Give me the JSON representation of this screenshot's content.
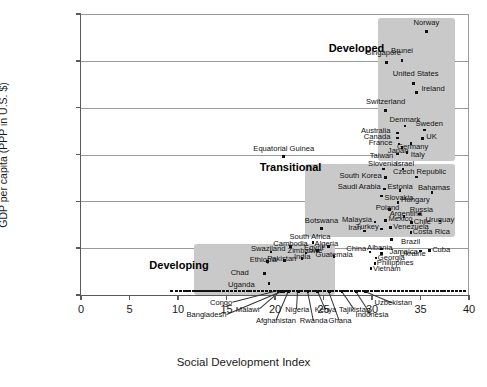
{
  "chart_data": {
    "type": "scatter",
    "title": "",
    "xlabel": "Social Development Index",
    "ylabel": "GDP per capita (PPP in U.S. $)",
    "xlim": [
      0,
      40
    ],
    "ylim": [
      0,
      60000
    ],
    "xticks": [
      "0",
      "5",
      "10",
      "15",
      "20",
      "25",
      "30",
      "35",
      "40"
    ],
    "xtick_values": [
      0,
      5,
      10,
      15,
      20,
      25,
      30,
      35,
      40
    ],
    "yticks": [
      "$0",
      "$10,000",
      "$20,000",
      "$30,000",
      "$40,000",
      "$50,000",
      "$60,000"
    ],
    "ytick_values": [
      0,
      10000,
      20000,
      30000,
      40000,
      50000,
      60000
    ],
    "grid": "horizontal",
    "legend": "none",
    "marker_color": "#111111",
    "cluster_fill": "#c9c9c9",
    "clusters": [
      {
        "name": "Developed",
        "label": "Developed",
        "label_x": 28.4,
        "label_y": 52600,
        "box_x0": 30.6,
        "box_x1": 38.6,
        "box_y0": 28600,
        "box_y1": 59100
      },
      {
        "name": "Transitional",
        "label": "Transitional",
        "label_x": 21.6,
        "label_y": 27200,
        "box_x0": 23.1,
        "box_x1": 38.6,
        "box_y0": 12400,
        "box_y1": 28000
      },
      {
        "name": "Developing",
        "label": "Developing",
        "label_x": 10.1,
        "label_y": 6100,
        "box_x0": 11.6,
        "box_x1": 26.2,
        "box_y0": -900,
        "box_y1": 10900
      }
    ],
    "points": [
      {
        "name": "Norway",
        "x": 35.6,
        "y": 56200,
        "lx": 35.6,
        "ly": 58000,
        "anchor": "c"
      },
      {
        "name": "Brunei",
        "x": 33.1,
        "y": 50100,
        "lx": 33.1,
        "ly": 52000,
        "anchor": "c"
      },
      {
        "name": "Singapore",
        "x": 31.5,
        "y": 49700,
        "lx": 31.2,
        "ly": 51600,
        "anchor": "c"
      },
      {
        "name": "United States",
        "x": 34.3,
        "y": 45200,
        "lx": 34.5,
        "ly": 47200,
        "anchor": "c"
      },
      {
        "name": "Ireland",
        "x": 34.6,
        "y": 43300,
        "lx": 35.1,
        "ly": 43900,
        "anchor": "l"
      },
      {
        "name": "Switzerland",
        "x": 31.4,
        "y": 39400,
        "lx": 31.4,
        "ly": 41300,
        "anchor": "c"
      },
      {
        "name": "Denmark",
        "x": 33.4,
        "y": 36100,
        "lx": 33.4,
        "ly": 37300,
        "anchor": "c"
      },
      {
        "name": "Sweden",
        "x": 35.4,
        "y": 35200,
        "lx": 35.9,
        "ly": 36500,
        "anchor": "c"
      },
      {
        "name": "Australia",
        "x": 32.6,
        "y": 34600,
        "lx": 31.9,
        "ly": 35100,
        "anchor": "r"
      },
      {
        "name": "Canada",
        "x": 32.6,
        "y": 33500,
        "lx": 31.9,
        "ly": 33700,
        "anchor": "r"
      },
      {
        "name": "UK",
        "x": 35.2,
        "y": 33400,
        "lx": 35.6,
        "ly": 33700,
        "anchor": "l"
      },
      {
        "name": "France",
        "x": 32.8,
        "y": 32200,
        "lx": 32.1,
        "ly": 32400,
        "anchor": "r"
      },
      {
        "name": "Germany",
        "x": 34.0,
        "y": 32300,
        "lx": 34.2,
        "ly": 31500,
        "anchor": "c"
      },
      {
        "name": "Japan",
        "x": 33.1,
        "y": 31500,
        "lx": 32.7,
        "ly": 30700,
        "anchor": "c"
      },
      {
        "name": "Italy",
        "x": 33.6,
        "y": 30400,
        "lx": 34.0,
        "ly": 29900,
        "anchor": "l"
      },
      {
        "name": "Taiwan",
        "x": 32.6,
        "y": 30100,
        "lx": 32.2,
        "ly": 29700,
        "anchor": "r"
      },
      {
        "name": "Equatorial Guinea",
        "x": 20.9,
        "y": 29600,
        "lx": 20.9,
        "ly": 31200,
        "anchor": "c"
      },
      {
        "name": "Slovenia",
        "x": 31.2,
        "y": 26900,
        "lx": 31.1,
        "ly": 28000,
        "anchor": "c"
      },
      {
        "name": "Israel",
        "x": 33.2,
        "y": 26900,
        "lx": 33.4,
        "ly": 28000,
        "anchor": "c"
      },
      {
        "name": "Czech Republic",
        "x": 34.6,
        "y": 25200,
        "lx": 34.9,
        "ly": 26300,
        "anchor": "c"
      },
      {
        "name": "South Korea",
        "x": 31.4,
        "y": 25100,
        "lx": 31.0,
        "ly": 25400,
        "anchor": "r"
      },
      {
        "name": "Saudi Arabia",
        "x": 31.3,
        "y": 22600,
        "lx": 30.9,
        "ly": 23000,
        "anchor": "r"
      },
      {
        "name": "Estonia",
        "x": 32.9,
        "y": 22300,
        "lx": 32.9,
        "ly": 23000,
        "anchor": "c"
      },
      {
        "name": "Bahamas",
        "x": 36.2,
        "y": 21900,
        "lx": 36.4,
        "ly": 22800,
        "anchor": "c"
      },
      {
        "name": "Slovakia",
        "x": 31.0,
        "y": 21100,
        "lx": 31.3,
        "ly": 20700,
        "anchor": "l"
      },
      {
        "name": "Hungary",
        "x": 32.7,
        "y": 19800,
        "lx": 33.0,
        "ly": 20200,
        "anchor": "l"
      },
      {
        "name": "Poland",
        "x": 31.8,
        "y": 18200,
        "lx": 31.6,
        "ly": 18600,
        "anchor": "c"
      },
      {
        "name": "Russia",
        "x": 34.9,
        "y": 17300,
        "lx": 35.1,
        "ly": 18200,
        "anchor": "c"
      },
      {
        "name": "Argentina",
        "x": 33.3,
        "y": 16800,
        "lx": 33.5,
        "ly": 17400,
        "anchor": "c"
      },
      {
        "name": "Mexico",
        "x": 31.4,
        "y": 15900,
        "lx": 31.7,
        "ly": 16200,
        "anchor": "l"
      },
      {
        "name": "Chile",
        "x": 34.1,
        "y": 15500,
        "lx": 34.3,
        "ly": 15600,
        "anchor": "l"
      },
      {
        "name": "Uruguay",
        "x": 37.0,
        "y": 15800,
        "lx": 37.0,
        "ly": 16000,
        "anchor": "c"
      },
      {
        "name": "Malaysia",
        "x": 30.3,
        "y": 15600,
        "lx": 30.0,
        "ly": 16000,
        "anchor": "r"
      },
      {
        "name": "Venezuela",
        "x": 31.9,
        "y": 14400,
        "lx": 32.2,
        "ly": 14600,
        "anchor": "l"
      },
      {
        "name": "Turkey",
        "x": 31.0,
        "y": 14100,
        "lx": 30.7,
        "ly": 14500,
        "anchor": "r"
      },
      {
        "name": "Costa Rica",
        "x": 34.0,
        "y": 13300,
        "lx": 34.2,
        "ly": 13500,
        "anchor": "l"
      },
      {
        "name": "Iran",
        "x": 29.2,
        "y": 13700,
        "lx": 28.9,
        "ly": 14400,
        "anchor": "r"
      },
      {
        "name": "Botswana",
        "x": 24.8,
        "y": 14200,
        "lx": 24.8,
        "ly": 15700,
        "anchor": "c"
      },
      {
        "name": "South Africa",
        "x": 23.9,
        "y": 11200,
        "lx": 23.6,
        "ly": 12400,
        "anchor": "c"
      },
      {
        "name": "Brazil",
        "x": 32.0,
        "y": 11800,
        "lx": 33.0,
        "ly": 11300,
        "anchor": "l"
      },
      {
        "name": "Cuba",
        "x": 35.9,
        "y": 9500,
        "lx": 36.2,
        "ly": 9700,
        "anchor": "l"
      },
      {
        "name": "Ukraine",
        "x": 35.0,
        "y": 9400,
        "lx": 34.2,
        "ly": 8800,
        "anchor": "c"
      },
      {
        "name": "Jamaica",
        "x": 31.0,
        "y": 8900,
        "lx": 31.8,
        "ly": 9100,
        "anchor": "l"
      },
      {
        "name": "Albania",
        "x": 31.0,
        "y": 9800,
        "lx": 30.8,
        "ly": 10100,
        "anchor": "c"
      },
      {
        "name": "China",
        "x": 29.8,
        "y": 9200,
        "lx": 29.4,
        "ly": 9800,
        "anchor": "r"
      },
      {
        "name": "Georgia",
        "x": 30.4,
        "y": 7900,
        "lx": 30.6,
        "ly": 8000,
        "anchor": "l"
      },
      {
        "name": "Philippines",
        "x": 30.3,
        "y": 6700,
        "lx": 30.5,
        "ly": 6800,
        "anchor": "l"
      },
      {
        "name": "Vietnam",
        "x": 29.9,
        "y": 5600,
        "lx": 30.1,
        "ly": 5500,
        "anchor": "l"
      },
      {
        "name": "Algeria",
        "x": 25.5,
        "y": 10400,
        "lx": 25.3,
        "ly": 10800,
        "anchor": "c"
      },
      {
        "name": "Egypt",
        "x": 24.4,
        "y": 9500,
        "lx": 24.0,
        "ly": 10000,
        "anchor": "c"
      },
      {
        "name": "Zimbabwe",
        "x": 23.2,
        "y": 9000,
        "lx": 23.1,
        "ly": 9400,
        "anchor": "c"
      },
      {
        "name": "Guatemala",
        "x": 26.1,
        "y": 8200,
        "lx": 26.1,
        "ly": 8500,
        "anchor": "c"
      },
      {
        "name": "Cambodia",
        "x": 21.6,
        "y": 10300,
        "lx": 21.6,
        "ly": 10900,
        "anchor": "c"
      },
      {
        "name": "Swaziland",
        "x": 19.6,
        "y": 9200,
        "lx": 19.3,
        "ly": 9900,
        "anchor": "c"
      },
      {
        "name": "India",
        "x": 22.8,
        "y": 7800,
        "lx": 22.8,
        "ly": 8200,
        "anchor": "c"
      },
      {
        "name": "Pakistan",
        "x": 21.0,
        "y": 7400,
        "lx": 20.7,
        "ly": 7700,
        "anchor": "c"
      },
      {
        "name": "Ethiopia",
        "x": 19.2,
        "y": 7100,
        "lx": 18.8,
        "ly": 7500,
        "anchor": "c"
      },
      {
        "name": "Chad",
        "x": 18.9,
        "y": 4600,
        "lx": 17.3,
        "ly": 4800,
        "anchor": "r"
      },
      {
        "name": "Uganda",
        "x": 19.4,
        "y": 2400,
        "lx": 17.9,
        "ly": 2100,
        "anchor": "r"
      },
      {
        "name": "Congo",
        "x": 20.3,
        "y": 800,
        "lx": 15.6,
        "ly": -1700,
        "anchor": "r"
      },
      {
        "name": "Malawi",
        "x": 20.6,
        "y": 800,
        "lx": 18.4,
        "ly": -3100,
        "anchor": "r"
      },
      {
        "name": "Bangladesh",
        "x": 20.9,
        "y": 800,
        "lx": 15.0,
        "ly": -4300,
        "anchor": "r"
      },
      {
        "name": "Afghanistan",
        "x": 21.4,
        "y": 800,
        "lx": 20.1,
        "ly": -5500,
        "anchor": "c"
      },
      {
        "name": "Nigeria",
        "x": 22.4,
        "y": 800,
        "lx": 22.3,
        "ly": -3100,
        "anchor": "c"
      },
      {
        "name": "Rwanda",
        "x": 23.4,
        "y": 800,
        "lx": 24.0,
        "ly": -5500,
        "anchor": "c"
      },
      {
        "name": "Kenya",
        "x": 24.4,
        "y": 800,
        "lx": 25.2,
        "ly": -3100,
        "anchor": "c"
      },
      {
        "name": "Ghana",
        "x": 25.6,
        "y": 800,
        "lx": 26.7,
        "ly": -5500,
        "anchor": "c"
      },
      {
        "name": "Tajikistan",
        "x": 26.9,
        "y": 800,
        "lx": 28.2,
        "ly": -3100,
        "anchor": "c"
      },
      {
        "name": "Indonesia",
        "x": 28.4,
        "y": 800,
        "lx": 30.0,
        "ly": -4300,
        "anchor": "c"
      },
      {
        "name": "Uzbekistan",
        "x": 29.3,
        "y": 800,
        "lx": 32.2,
        "ly": -1700,
        "anchor": "c"
      }
    ],
    "baseline_band_note": "dense row of unlabeled country markers along y = $0",
    "baseline_band_x": [
      11.2,
      11.6,
      11.9,
      12.2,
      12.5,
      12.8,
      13.1,
      13.4,
      13.7,
      14.0,
      14.3,
      14.7,
      15.1,
      15.5,
      15.9,
      16.3,
      16.7,
      17.1,
      17.5,
      17.9,
      18.3,
      18.7,
      19.1,
      19.5,
      19.9,
      20.3,
      20.7,
      21.1,
      21.5,
      21.9,
      22.3,
      22.7,
      23.1,
      23.5,
      23.9,
      24.3,
      24.7,
      25.1,
      25.5,
      25.9,
      26.3,
      26.7,
      27.1,
      27.5,
      27.9,
      28.3,
      28.7,
      29.1,
      29.5,
      29.9,
      30.3,
      30.7,
      31.1,
      31.5,
      31.9,
      32.3,
      32.7,
      33.1,
      33.5,
      33.9,
      34.3,
      34.7,
      35.1,
      35.5,
      35.9,
      36.3,
      36.7,
      37.1,
      37.5,
      37.9,
      38.3,
      38.7,
      39.1,
      39.5
    ],
    "baseline_band_low_x": [
      9.3,
      9.8,
      10.2,
      10.6,
      11.0
    ]
  }
}
